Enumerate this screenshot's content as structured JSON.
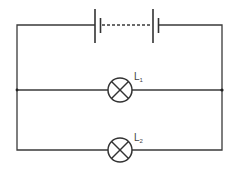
{
  "diagram": {
    "type": "circuit",
    "components": [
      {
        "id": "battery",
        "kind": "battery-multi-cell",
        "label": ""
      },
      {
        "id": "L1",
        "kind": "lamp",
        "label_main": "L",
        "label_sub": "1"
      },
      {
        "id": "L2",
        "kind": "lamp",
        "label_main": "L",
        "label_sub": "2"
      }
    ],
    "connections": "parallel",
    "colors": {
      "line": "#333333",
      "background": "#ffffff"
    }
  },
  "labels": {
    "lamp1": {
      "main": "L",
      "sub": "1"
    },
    "lamp2": {
      "main": "L",
      "sub": "2"
    }
  }
}
